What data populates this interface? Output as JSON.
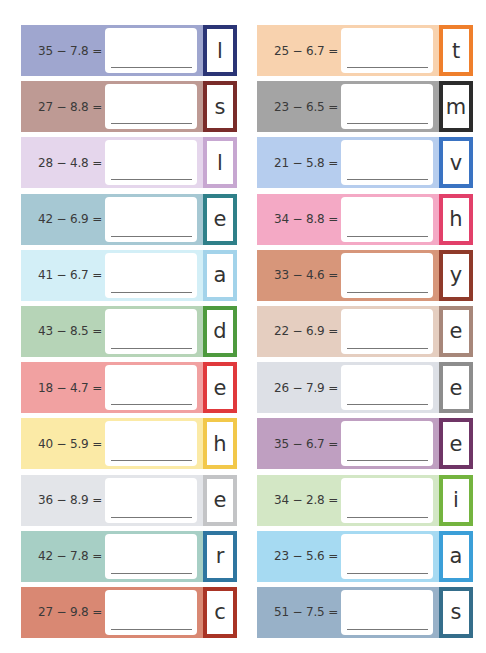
{
  "worksheet": {
    "left_column": [
      {
        "equation": "35 − 7.8 =",
        "letter": "l",
        "band_color": "#9fa6cf",
        "border_color": "#2b3576"
      },
      {
        "equation": "27 − 8.8 =",
        "letter": "s",
        "band_color": "#be9a94",
        "border_color": "#7a2c2a"
      },
      {
        "equation": "28 − 4.8 =",
        "letter": "l",
        "band_color": "#e5d6ec",
        "border_color": "#c7a7d1"
      },
      {
        "equation": "42 − 6.9 =",
        "letter": "e",
        "band_color": "#a6c8d3",
        "border_color": "#2f8089"
      },
      {
        "equation": "41 − 6.7 =",
        "letter": "a",
        "band_color": "#d3eff7",
        "border_color": "#a3d3ea"
      },
      {
        "equation": "43 − 8.5 =",
        "letter": "d",
        "band_color": "#b6d4b7",
        "border_color": "#4e9a3e"
      },
      {
        "equation": "18 − 4.7 =",
        "letter": "e",
        "band_color": "#f1a1a1",
        "border_color": "#e0393c"
      },
      {
        "equation": "40 − 5.9 =",
        "letter": "h",
        "band_color": "#fbeaa6",
        "border_color": "#f2c84a"
      },
      {
        "equation": "36 − 8.9 =",
        "letter": "e",
        "band_color": "#e3e5e9",
        "border_color": "#c3c4c6"
      },
      {
        "equation": "42 − 7.8 =",
        "letter": "r",
        "band_color": "#a7cfc5",
        "border_color": "#2f76a0"
      },
      {
        "equation": "27 − 9.8 =",
        "letter": "c",
        "band_color": "#d98873",
        "border_color": "#a93425"
      }
    ],
    "right_column": [
      {
        "equation": "25 − 6.7 =",
        "letter": "t",
        "band_color": "#f8d2ae",
        "border_color": "#ef7f2c"
      },
      {
        "equation": "23 − 6.5 =",
        "letter": "m",
        "band_color": "#a4a4a4",
        "border_color": "#2c2c2c"
      },
      {
        "equation": "21 − 5.8 =",
        "letter": "v",
        "band_color": "#b6cdee",
        "border_color": "#3a73c2"
      },
      {
        "equation": "34 − 8.8 =",
        "letter": "h",
        "band_color": "#f4a9c5",
        "border_color": "#e2406a"
      },
      {
        "equation": "33 − 4.6 =",
        "letter": "y",
        "band_color": "#d7967a",
        "border_color": "#8f3a2a"
      },
      {
        "equation": "22 − 6.9 =",
        "letter": "e",
        "band_color": "#e5cec0",
        "border_color": "#a7877a"
      },
      {
        "equation": "26 − 7.9 =",
        "letter": "e",
        "band_color": "#dde0e6",
        "border_color": "#8d8d8d"
      },
      {
        "equation": "35 − 6.7 =",
        "letter": "e",
        "band_color": "#bf9fc1",
        "border_color": "#6f3566"
      },
      {
        "equation": "34 − 2.8 =",
        "letter": "i",
        "band_color": "#d3e7c5",
        "border_color": "#74b43f"
      },
      {
        "equation": "23 − 5.6 =",
        "letter": "a",
        "band_color": "#a6daf2",
        "border_color": "#3b9fd8"
      },
      {
        "equation": "51 − 7.5 =",
        "letter": "s",
        "band_color": "#98b1c8",
        "border_color": "#356e8b"
      }
    ]
  }
}
